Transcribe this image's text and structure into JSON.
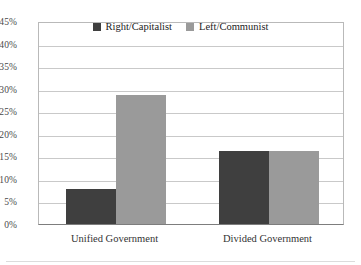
{
  "chart_data": {
    "type": "bar",
    "title": "",
    "subtitle": "",
    "xlabel": "",
    "ylabel": "",
    "categories": [
      "Unified Government",
      "Divided Government"
    ],
    "series": [
      {
        "name": "Right/Capitalist",
        "color": "#3f3f3f",
        "values": [
          7.8,
          16.2
        ]
      },
      {
        "name": "Left/Communist",
        "color": "#9a9a9a",
        "values": [
          28.5,
          16.2
        ]
      }
    ],
    "ylim": [
      0,
      45
    ],
    "ytick_step": 5,
    "ytick_labels": [
      "0%",
      "5%",
      "10%",
      "15%",
      "20%",
      "25%",
      "30%",
      "35%",
      "40%",
      "45%"
    ],
    "ytick_values": [
      0,
      5,
      10,
      15,
      20,
      25,
      30,
      35,
      40,
      45
    ],
    "grid": "horizontal",
    "legend_position": "top-center",
    "value_format": "percent"
  },
  "legend": {
    "items": [
      {
        "label": "Right/Capitalist",
        "color": "#3f3f3f",
        "swatch": "square-swatch-dark"
      },
      {
        "label": "Left/Communist",
        "color": "#9a9a9a",
        "swatch": "square-swatch-light"
      }
    ]
  },
  "axes": {
    "y": {
      "ticks": [
        {
          "label": "45%",
          "value": 45
        },
        {
          "label": "40%",
          "value": 40
        },
        {
          "label": "35%",
          "value": 35
        },
        {
          "label": "30%",
          "value": 30
        },
        {
          "label": "25%",
          "value": 25
        },
        {
          "label": "20%",
          "value": 20
        },
        {
          "label": "15%",
          "value": 15
        },
        {
          "label": "10%",
          "value": 10
        },
        {
          "label": "5%",
          "value": 5
        },
        {
          "label": "0%",
          "value": 0
        }
      ]
    },
    "x": {
      "ticks": [
        {
          "label": "Unified Government"
        },
        {
          "label": "Divided Government"
        }
      ]
    }
  },
  "colors": {
    "series_dark": "#3f3f3f",
    "series_light": "#9a9a9a",
    "gridline": "#c9c9c9",
    "axis": "#7d7d7d",
    "text": "#333333",
    "background": "#ffffff"
  }
}
